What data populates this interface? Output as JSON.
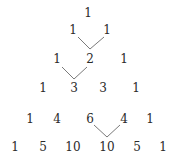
{
  "rows": [
    {
      "values": [
        "1"
      ],
      "y": 13,
      "x": [
        88
      ]
    },
    {
      "values": [
        "1",
        "1"
      ],
      "y": 30,
      "x": [
        73,
        107
      ]
    },
    {
      "values": [
        "1",
        "2",
        "1"
      ],
      "y": 59,
      "x": [
        57,
        90,
        124
      ]
    },
    {
      "values": [
        "1",
        "3",
        "3",
        "1"
      ],
      "y": 88,
      "x": [
        43,
        74,
        103,
        136
      ]
    },
    {
      "values": [
        "1",
        "4",
        "6",
        "4",
        "1"
      ],
      "y": 119,
      "x": [
        30,
        57,
        90,
        124,
        150
      ]
    },
    {
      "values": [
        "1",
        "5",
        "10",
        "10",
        "5",
        "1"
      ],
      "y": 147,
      "x": [
        15,
        43,
        73,
        107,
        137,
        163
      ]
    }
  ],
  "connectors": [
    {
      "from_row": 1,
      "to": "2",
      "points": "78,37 90,49 104,37"
    },
    {
      "from_row": 2,
      "to": "3",
      "points": "62,67 74,79 87,67"
    },
    {
      "from_row": 4,
      "to": "10",
      "points": "94,125 107,137 120,125"
    }
  ],
  "colors": {
    "text": "#2a2a2a",
    "line": "#7a7a7a",
    "background": "#ffffff"
  }
}
